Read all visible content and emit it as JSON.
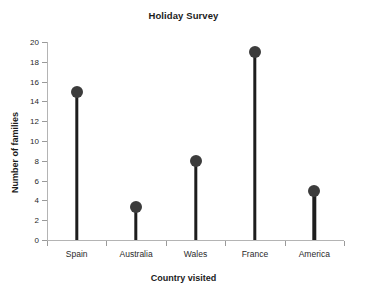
{
  "chart_data": {
    "type": "bar",
    "title": "Holiday Survey",
    "xlabel": "Country visited",
    "ylabel": "Number of families",
    "categories": [
      "Spain",
      "Australia",
      "Wales",
      "France",
      "America"
    ],
    "values": [
      15,
      3.3,
      8,
      19,
      5
    ],
    "ylim": [
      0,
      20
    ],
    "ytick_labels": [
      "0",
      "2",
      "4",
      "6",
      "8",
      "10",
      "12",
      "14",
      "16",
      "18",
      "20"
    ],
    "ytick_values": [
      0,
      2,
      4,
      6,
      8,
      10,
      12,
      14,
      16,
      18,
      20
    ],
    "grid": false,
    "legend": "none",
    "marker_color": "#3c3c3c",
    "stem_color": "#1e1e1e",
    "axis_color": "#b4b4b4",
    "background": "#ffffff"
  }
}
